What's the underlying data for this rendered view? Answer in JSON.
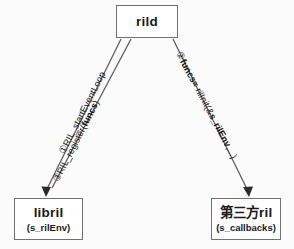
{
  "diagram": {
    "type": "call-flow-diagram",
    "nodes": [
      {
        "id": "rild",
        "title": "rild",
        "subtitle": ""
      },
      {
        "id": "libril",
        "title": "libril",
        "subtitle": "(s_rilEnv)"
      },
      {
        "id": "thirdparty",
        "title": "第三方ril",
        "subtitle": "(s_callbacks)"
      }
    ],
    "edges": [
      {
        "id": "edge-1",
        "from": "rild",
        "to": "libril",
        "step": "①",
        "text": "RIL_startEventLoop",
        "bold_text": ""
      },
      {
        "id": "edge-3",
        "from": "rild",
        "to": "libril",
        "step": "③",
        "text": "RIL_register(",
        "bold_text": "funcs",
        "text_tail": ")"
      },
      {
        "id": "edge-2",
        "from": "rild",
        "to": "thirdparty",
        "step": "②",
        "bold_lead": "funcs=",
        "text": " rilInit(&",
        "bold_text": "s_rilEnv",
        "text_tail": ",...)"
      }
    ],
    "colors": {
      "box_border": "#707070",
      "line": "#5a5a5a",
      "text": "#111111",
      "background": "#fbfbfb"
    }
  }
}
